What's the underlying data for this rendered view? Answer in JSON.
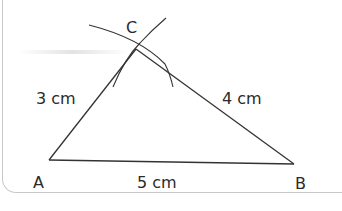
{
  "diagram": {
    "type": "triangle-construction",
    "vertices": {
      "A": {
        "label": "A",
        "x": 49,
        "y": 160
      },
      "B": {
        "label": "B",
        "x": 294,
        "y": 164
      },
      "C": {
        "label": "C",
        "x": 136,
        "y": 49
      }
    },
    "sides": {
      "AC": {
        "label": "3 cm"
      },
      "CB": {
        "label": "4 cm"
      },
      "AB": {
        "label": "5 cm"
      }
    },
    "construction_arcs": [
      {
        "center": "A",
        "radius_label": "3 cm"
      },
      {
        "center": "B",
        "radius_label": "4 cm"
      }
    ],
    "colors": {
      "line": "#333333",
      "border": "#c8c8c8"
    }
  }
}
